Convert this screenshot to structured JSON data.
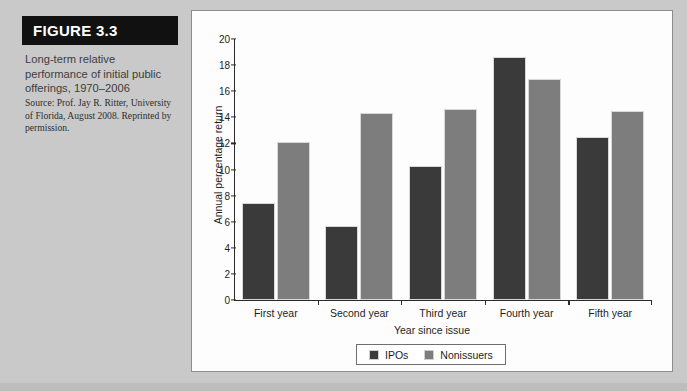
{
  "figure": {
    "banner_label": "FIGURE 3.3",
    "caption_title": "Long-term relative performance of initial public offerings, 1970–2006",
    "caption_source": "Source: Prof. Jay R. Ritter, University of Florida, August 2008. Reprinted by permission."
  },
  "colors": {
    "ipos": "#3a3a3a",
    "nonissuers": "#7d7d7d",
    "banner_bg": "#111111",
    "page_bg": "#c9c9c9",
    "panel_bg": "#fdfdfd",
    "axis": "#2b2b2b"
  },
  "chart_data": {
    "type": "bar",
    "title": "",
    "subtitle": "",
    "xlabel": "Year since issue",
    "ylabel": "Annual percentage return",
    "categories": [
      "First year",
      "Second year",
      "Third year",
      "Fourth year",
      "Fifth year"
    ],
    "series": [
      {
        "name": "IPOs",
        "color": "#3a3a3a",
        "values": [
          7.4,
          5.7,
          10.3,
          18.6,
          12.5
        ]
      },
      {
        "name": "Nonissuers",
        "color": "#7d7d7d",
        "values": [
          12.1,
          14.3,
          14.6,
          16.9,
          14.5
        ]
      }
    ],
    "ylim": [
      0,
      20
    ],
    "yticks": [
      0,
      2,
      4,
      6,
      8,
      10,
      12,
      14,
      16,
      18,
      20
    ],
    "ytick_labels": [
      "0",
      "2",
      "4",
      "6",
      "8",
      "10",
      "12",
      "14",
      "16",
      "18",
      "20"
    ],
    "grid": false,
    "legend_position": "bottom"
  }
}
